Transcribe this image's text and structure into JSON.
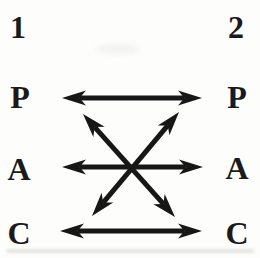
{
  "page": {
    "background": "#fdfdfc",
    "ink_color": "#171717"
  },
  "diagram": {
    "type": "transactional-analysis-communication-diagram",
    "person1": {
      "id": "1",
      "ego_states": [
        "P",
        "A",
        "C"
      ]
    },
    "person2": {
      "id": "2",
      "ego_states": [
        "P",
        "A",
        "C"
      ]
    },
    "connections": [
      {
        "from": "1.P",
        "to": "2.P",
        "arrows": "both",
        "shape": "horizontal"
      },
      {
        "from": "1.A",
        "to": "2.A",
        "arrows": "both",
        "shape": "horizontal"
      },
      {
        "from": "1.C",
        "to": "2.C",
        "arrows": "both",
        "shape": "horizontal"
      },
      {
        "from": "1.P",
        "to": "2.C",
        "arrows": "both",
        "shape": "diagonal"
      },
      {
        "from": "1.C",
        "to": "2.P",
        "arrows": "both",
        "shape": "diagonal"
      }
    ]
  }
}
